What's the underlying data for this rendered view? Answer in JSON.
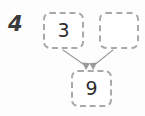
{
  "problem": {
    "number": "4",
    "type": "number-bond"
  },
  "boxes": {
    "part_left": {
      "value": "3",
      "filled": true
    },
    "part_right": {
      "value": "",
      "filled": false
    },
    "whole": {
      "value": "9",
      "filled": true
    }
  },
  "arrows": [
    {
      "name": "arrow-left-part-to-whole",
      "from": "part_left",
      "to": "whole"
    },
    {
      "name": "arrow-right-part-to-whole",
      "from": "part_right",
      "to": "whole"
    }
  ],
  "colors": {
    "background": "#fdfdfd",
    "box_border": "#a9a9a9",
    "box_fill": "#ffffff",
    "digit": "#2e2e2e",
    "problem_number": "#3b3b3b",
    "arrow": "#9a9a9a"
  }
}
